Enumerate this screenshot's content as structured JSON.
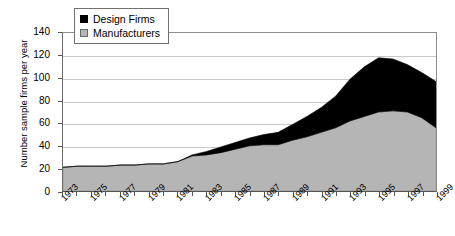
{
  "chart_data": {
    "type": "area",
    "stacked": true,
    "title": "",
    "xlabel": "",
    "ylabel": "Number sample firms per year",
    "ylim": [
      0,
      140
    ],
    "ytick_step": 20,
    "yticks": [
      0,
      20,
      40,
      60,
      80,
      100,
      120,
      140
    ],
    "grid": true,
    "legend_position": "top-left-inside",
    "x": [
      1973,
      1974,
      1975,
      1976,
      1977,
      1978,
      1979,
      1980,
      1981,
      1982,
      1983,
      1984,
      1985,
      1986,
      1987,
      1988,
      1989,
      1990,
      1991,
      1992,
      1993,
      1994,
      1995,
      1996,
      1997,
      1998,
      1999
    ],
    "xtick_labels": [
      "1973",
      "1975",
      "1977",
      "1979",
      "1981",
      "1983",
      "1985",
      "1987",
      "1989",
      "1991",
      "1993",
      "1995",
      "1997",
      "1999"
    ],
    "series": [
      {
        "name": "Manufacturers",
        "color": "#b5b5b5",
        "values": [
          21,
          22,
          22,
          22,
          23,
          23,
          24,
          24,
          26,
          31,
          32,
          34,
          37,
          40,
          41,
          41,
          45,
          48,
          52,
          56,
          62,
          66,
          70,
          71,
          70,
          65,
          56
        ]
      },
      {
        "name": "Design Firms",
        "color": "#000000",
        "values": [
          0,
          0,
          0,
          0,
          0,
          0,
          0,
          0,
          0,
          1,
          3,
          5,
          6,
          7,
          9,
          11,
          14,
          18,
          22,
          28,
          37,
          44,
          48,
          46,
          42,
          40,
          41
        ]
      }
    ],
    "totals": [
      21,
      22,
      22,
      22,
      23,
      23,
      24,
      24,
      26,
      32,
      35,
      39,
      43,
      47,
      50,
      52,
      59,
      66,
      74,
      84,
      99,
      110,
      118,
      117,
      112,
      105,
      97
    ]
  },
  "legend": {
    "items": [
      {
        "label": "Design Firms",
        "swatch": "black-square-swatch"
      },
      {
        "label": "Manufacturers",
        "swatch": "gray-square-swatch"
      }
    ]
  },
  "axes": {
    "y_title": "Number sample firms per year"
  }
}
